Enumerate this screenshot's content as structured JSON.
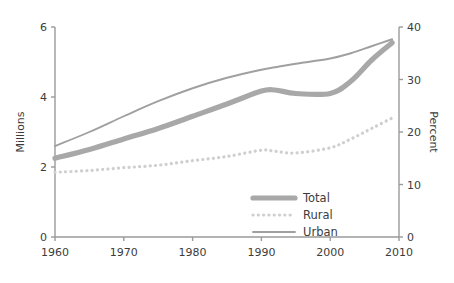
{
  "chart_data": {
    "type": "line",
    "title": "",
    "subtitle": "",
    "xlabel": "",
    "ylabel": "Millions",
    "y2label": "Percent",
    "xlim": [
      1960,
      2010
    ],
    "ylim": [
      0,
      6
    ],
    "y2lim": [
      0,
      40
    ],
    "grid": false,
    "legend_position": "bottom-right",
    "xticks": [
      1960,
      1970,
      1980,
      1990,
      2000,
      2010
    ],
    "xtick_labels": [
      "1960",
      "1970",
      "1980",
      "1990",
      "2000",
      "2010"
    ],
    "yticks": [
      0,
      2,
      4,
      6
    ],
    "ytick_labels": [
      "0",
      "2",
      "4",
      "6"
    ],
    "y2ticks": [
      0,
      10,
      20,
      30,
      40
    ],
    "y2tick_labels": [
      "0",
      "10",
      "20",
      "30",
      "40"
    ],
    "x": [
      1960,
      1965,
      1970,
      1975,
      1980,
      1985,
      1990,
      1992,
      1995,
      2000,
      2003,
      2006,
      2009
    ],
    "series": [
      {
        "name": "Total",
        "style": "thick-solid",
        "color": "#a8a8a8",
        "values": [
          2.25,
          2.5,
          2.8,
          3.1,
          3.45,
          3.8,
          4.17,
          4.2,
          4.1,
          4.1,
          4.45,
          5.05,
          5.55
        ]
      },
      {
        "name": "Rural",
        "style": "dotted",
        "color": "#cfcfcf",
        "values": [
          1.85,
          1.9,
          1.98,
          2.05,
          2.18,
          2.3,
          2.48,
          2.45,
          2.4,
          2.55,
          2.8,
          3.1,
          3.4
        ]
      },
      {
        "name": "Urban",
        "style": "thin-solid",
        "color": "#a0a0a0",
        "values": [
          2.6,
          3.0,
          3.45,
          3.88,
          4.25,
          4.55,
          4.78,
          4.85,
          4.95,
          5.1,
          5.25,
          5.45,
          5.65
        ]
      }
    ]
  },
  "legend": {
    "items": [
      {
        "label": "Total"
      },
      {
        "label": "Rural"
      },
      {
        "label": "Urban"
      }
    ]
  },
  "axes": {
    "left_title": "Millions",
    "right_title": "Percent"
  }
}
